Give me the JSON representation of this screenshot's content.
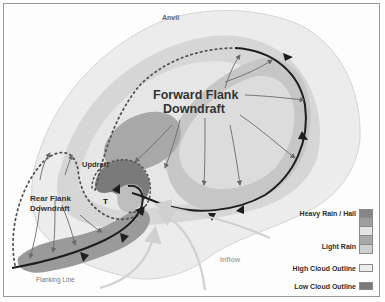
{
  "diagram": {
    "type": "supercell thunderstorm plan view",
    "labels": {
      "anvil": "Anvil",
      "forward_flank_line1": "Forward Flank",
      "forward_flank_line2": "Downdraft",
      "updraft": "Updraft",
      "rear_flank_line1": "Rear Flank",
      "rear_flank_line2": "Downdraft",
      "tornado_marker": "T",
      "inflow": "Inflow",
      "flanking_line": "Flanking Line"
    },
    "colors": {
      "high_cloud": "#ececec",
      "low_cloud": "#7a7a7a",
      "rain_level_1": "#b9b9b9",
      "rain_level_2": "#dadada",
      "rain_level_3": "#e6e6e6",
      "rain_level_4": "#9e9e9e",
      "rain_level_5": "#858585",
      "front_line": "#1e1e1e",
      "arrow": "#6a6a6a",
      "inflow_arrow": "#cfcfcf"
    }
  },
  "legend": {
    "heavy_rain": "Heavy Rain / Hail",
    "light_rain": "Light Rain",
    "high_cloud": "High Cloud Outline",
    "low_cloud": "Low Cloud Outline",
    "rain_scale": [
      "#858585",
      "#9e9e9e",
      "#e3e3e3",
      "#a8a8a8",
      "#cfcfcf"
    ],
    "high_cloud_swatch": "#ececec",
    "low_cloud_swatch": "#7a7a7a"
  }
}
